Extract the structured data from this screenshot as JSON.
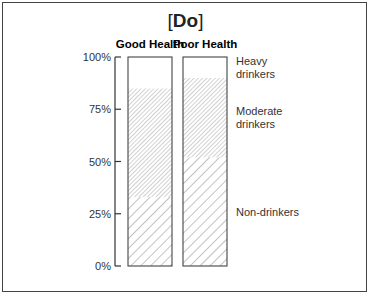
{
  "chart_data": {
    "type": "bar",
    "stacked": true,
    "title": "[Do]",
    "title_bracket_open": "[",
    "title_text": "Do",
    "title_bracket_close": "]",
    "xlabel": "",
    "ylabel": "",
    "ylim": [
      0,
      100
    ],
    "yticks": [
      0,
      25,
      50,
      75,
      100
    ],
    "ytick_labels": [
      "0%",
      "25%",
      "50%",
      "75%",
      "100%"
    ],
    "categories": [
      "Good Health",
      "Poor Health"
    ],
    "series": [
      {
        "name": "Non-drinkers",
        "label_lines": [
          "Non-drinkers"
        ],
        "values": [
          33,
          52
        ],
        "pattern": "wide-hatch"
      },
      {
        "name": "Moderate drinkers",
        "label_lines": [
          "Moderate",
          "drinkers"
        ],
        "values": [
          52,
          38
        ],
        "pattern": "dense-hatch"
      },
      {
        "name": "Heavy drinkers",
        "label_lines": [
          "Heavy",
          "drinkers"
        ],
        "values": [
          15,
          10
        ],
        "pattern": "none"
      }
    ],
    "legend_placement": "right",
    "grid": false
  }
}
